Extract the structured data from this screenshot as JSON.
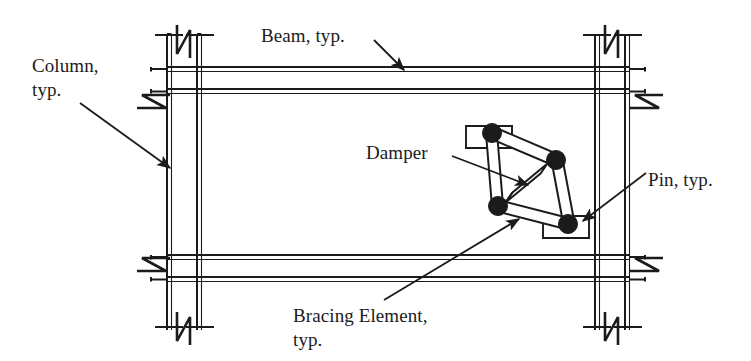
{
  "figure": {
    "type": "engineering-diagram",
    "background_color": "#ffffff",
    "line_color": "#1b1b1b"
  },
  "labels": {
    "column": "Column,\ntyp.",
    "beam": "Beam, typ.",
    "damper": "Damper",
    "pin": "Pin, typ.",
    "bracing": "Bracing Element,\ntyp."
  },
  "components": {
    "columns": [
      {
        "name": "left-column",
        "x_center": 184,
        "flange_width": 34,
        "web_gap": 20
      },
      {
        "name": "right-column",
        "x_center": 612,
        "flange_width": 34,
        "web_gap": 20
      }
    ],
    "beams": [
      {
        "name": "upper-beam",
        "y_center": 80,
        "depth": 26
      },
      {
        "name": "lower-beam",
        "y_center": 268,
        "depth": 26
      }
    ],
    "break_symbols": [
      {
        "name": "break-top-left",
        "x": 184,
        "y": 34
      },
      {
        "name": "break-bottom-left",
        "x": 184,
        "y": 322
      },
      {
        "name": "break-left-upper",
        "x": 152,
        "y": 92
      },
      {
        "name": "break-left-lower",
        "x": 152,
        "y": 282
      },
      {
        "name": "break-top-right",
        "x": 612,
        "y": 34
      },
      {
        "name": "break-bottom-right",
        "x": 612,
        "y": 322
      },
      {
        "name": "break-right-upper",
        "x": 644,
        "y": 92
      },
      {
        "name": "break-right-lower",
        "x": 644,
        "y": 282
      }
    ],
    "pins": [
      {
        "name": "pin-top",
        "x": 492,
        "y": 133,
        "r": 9
      },
      {
        "name": "pin-right",
        "x": 556,
        "y": 160,
        "r": 9
      },
      {
        "name": "pin-left",
        "x": 498,
        "y": 206,
        "r": 9
      },
      {
        "name": "pin-bottom",
        "x": 568,
        "y": 224,
        "r": 9
      }
    ],
    "gusset_plates": [
      {
        "name": "gusset-upper",
        "x": 466,
        "y": 126,
        "w": 46,
        "h": 22
      },
      {
        "name": "gusset-lower",
        "x": 543,
        "y": 216,
        "w": 46,
        "h": 22
      }
    ],
    "damper_element": {
      "name": "damper-diagonal",
      "from_x": 543,
      "from_y": 169,
      "to_x": 508,
      "to_y": 198,
      "width": 11
    }
  },
  "leaders": [
    {
      "name": "leader-column",
      "from_x": 80,
      "from_y": 103,
      "to_x": 172,
      "to_y": 170
    },
    {
      "name": "leader-beam",
      "from_x": 374,
      "from_y": 40,
      "to_x": 404,
      "to_y": 72
    },
    {
      "name": "leader-damper",
      "from_x": 452,
      "from_y": 156,
      "to_x": 527,
      "to_y": 184
    },
    {
      "name": "leader-pin",
      "from_x": 644,
      "from_y": 174,
      "to_x": 580,
      "to_y": 222
    },
    {
      "name": "leader-brace",
      "from_x": 384,
      "from_y": 300,
      "to_x": 518,
      "to_y": 218
    }
  ]
}
